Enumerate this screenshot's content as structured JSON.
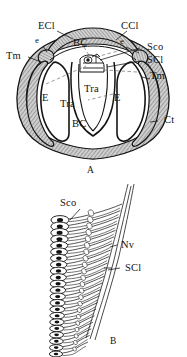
{
  "figure": {
    "type": "scientific-illustration",
    "panels": [
      {
        "id": "A",
        "letter": "A",
        "caption": "A",
        "description": "Cross-section through tympanal organ showing cuticle, tympanal membranes, tracheal chambers and scolopidia",
        "labels": [
          {
            "key": "ecl",
            "text": "ECl",
            "x": 38,
            "y": 27
          },
          {
            "key": "ccl",
            "text": "CCl",
            "x": 121,
            "y": 27
          },
          {
            "key": "e_left",
            "text": "e",
            "x": 37,
            "y": 41
          },
          {
            "key": "e_right",
            "text": "e",
            "x": 120,
            "y": 42
          },
          {
            "key": "tm_left",
            "text": "Tm",
            "x": 9,
            "y": 57
          },
          {
            "key": "tm_right",
            "text": "Tm",
            "x": 144,
            "y": 73
          },
          {
            "key": "sco",
            "text": "Sco",
            "x": 142,
            "y": 44
          },
          {
            "key": "scl",
            "text": "SCl",
            "x": 142,
            "y": 57
          },
          {
            "key": "bc_top",
            "text": "BC",
            "x": 75,
            "y": 43
          },
          {
            "key": "bc_bottom",
            "text": "BC",
            "x": 74,
            "y": 124
          },
          {
            "key": "tra_left",
            "text": "Tra",
            "x": 64,
            "y": 103
          },
          {
            "key": "tra_right",
            "text": "Tra",
            "x": 87,
            "y": 88
          },
          {
            "key": "e_chamber_left",
            "text": "E",
            "x": 43,
            "y": 98
          },
          {
            "key": "e_chamber_right",
            "text": "E",
            "x": 115,
            "y": 98
          },
          {
            "key": "ct",
            "text": "Ct",
            "x": 160,
            "y": 119
          }
        ]
      },
      {
        "id": "B",
        "letter": "B",
        "caption": "B",
        "description": "Chain of scolopidia attached along the scolopale cells with nerve fibres",
        "labels": [
          {
            "key": "sco",
            "text": "Sco",
            "x": 62,
            "y": 202
          },
          {
            "key": "nv",
            "text": "Nv",
            "x": 119,
            "y": 245
          },
          {
            "key": "scl",
            "text": "SCl",
            "x": 122,
            "y": 268
          }
        ],
        "scolopidia_count": 22
      }
    ],
    "abbreviations": {
      "ECl": "ECl",
      "CCl": "CCl",
      "Tm": "Tm",
      "Sco": "Sco",
      "SCl": "SCl",
      "BC": "BC",
      "Tra": "Tra",
      "E": "E",
      "Ct": "Ct",
      "Nv": "Nv",
      "e": "e"
    },
    "colors": {
      "ink": "#141414",
      "line": "#1a1a1a",
      "hatch": "#8d8d8d",
      "hatch_fill": "#bdbdbd",
      "paper": "#ffffff"
    }
  }
}
